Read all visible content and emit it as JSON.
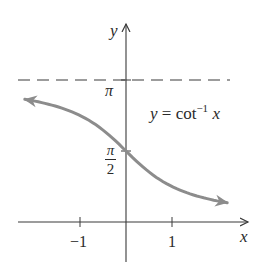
{
  "chart_data": {
    "type": "line",
    "title": "",
    "function": "y = cot^-1 x",
    "equation_label": {
      "lhs": "y = cot",
      "sup": "−1",
      "rhs": "x"
    },
    "xlabel": "x",
    "ylabel": "y",
    "x_ticks": [
      {
        "value": -1,
        "label": "−1"
      },
      {
        "value": 1,
        "label": "1"
      }
    ],
    "y_ticks": [
      {
        "value": 1.5708,
        "label_num": "π",
        "label_den": "2"
      },
      {
        "value": 3.1416,
        "label": "π"
      }
    ],
    "asymptote": {
      "y": 3.1416,
      "style": "dashed",
      "label": "π"
    },
    "xlim": [
      -2.4,
      2.7
    ],
    "ylim": [
      -0.9,
      4.3
    ],
    "x": [
      -2.2,
      -2.0,
      -1.5,
      -1.0,
      -0.5,
      0.0,
      0.5,
      1.0,
      1.5,
      2.0,
      2.2
    ],
    "values": [
      2.7144,
      2.6779,
      2.5536,
      2.3562,
      2.0344,
      1.5708,
      1.1071,
      0.7854,
      0.588,
      0.4636,
      0.4271
    ],
    "curve_arrows": "both ends",
    "grid": false,
    "legend": "none",
    "colors": {
      "curve": "#8c8c8c",
      "axes": "#3a3a3a",
      "text": "#2a2a2a",
      "background": "#ffffff"
    }
  }
}
